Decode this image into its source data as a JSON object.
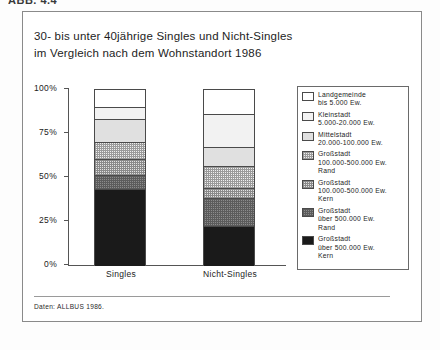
{
  "page": {
    "cut_header": "ABB. 4.4"
  },
  "title": {
    "line1": "30- bis unter 40jährige Singles und Nicht-Singles",
    "line2": "im Vergleich nach dem Wohnstandort 1986"
  },
  "source": "Daten: ALLBUS 1986.",
  "axis": {
    "y_ticks": [
      "100%",
      "75%",
      "50%",
      "25%",
      "0%"
    ],
    "y_tick_values": [
      100,
      75,
      50,
      25,
      0
    ]
  },
  "legend": {
    "items": [
      {
        "name": "Landgemeinde",
        "range": "bis 5.000 Ew.",
        "extra": "",
        "fill": "f0"
      },
      {
        "name": "Kleinstadt",
        "range": "5.000-20.000 Ew.",
        "extra": "",
        "fill": "f1"
      },
      {
        "name": "Mittelstadt",
        "range": "20.000-100.000 Ew.",
        "extra": "",
        "fill": "f2"
      },
      {
        "name": "Großstadt",
        "range": "100.000-500.000 Ew.",
        "extra": "Rand",
        "fill": "f3"
      },
      {
        "name": "Großstadt",
        "range": "100.000-500.000 Ew.",
        "extra": "Kern",
        "fill": "f4"
      },
      {
        "name": "Großstadt",
        "range": "über 500.000 Ew.",
        "extra": "Rand",
        "fill": "f5"
      },
      {
        "name": "Großstadt",
        "range": "über 500.000 Ew.",
        "extra": "Kern",
        "fill": "f6"
      }
    ]
  },
  "chart_data": {
    "type": "bar",
    "subtype": "stacked-100-percent",
    "title": "30- bis unter 40jährige Singles und Nicht-Singles im Vergleich nach dem Wohnstandort 1986",
    "xlabel": "",
    "ylabel": "",
    "ylim": [
      0,
      100
    ],
    "grid": false,
    "legend_position": "right",
    "categories": [
      "Singles",
      "Nicht-Singles"
    ],
    "series": [
      {
        "name": "Landgemeinde bis 5.000 Ew.",
        "fill": "f0",
        "values": [
          10,
          14
        ]
      },
      {
        "name": "Kleinstadt 5.000-20.000 Ew.",
        "fill": "f1",
        "values": [
          7,
          19
        ]
      },
      {
        "name": "Mittelstadt 20.000-100.000 Ew.",
        "fill": "f2",
        "values": [
          13,
          11
        ]
      },
      {
        "name": "Großstadt 100.000-500.000 Ew. Rand",
        "fill": "f3",
        "values": [
          10,
          12
        ]
      },
      {
        "name": "Großstadt 100.000-500.000 Ew. Kern",
        "fill": "f4",
        "values": [
          9,
          6
        ]
      },
      {
        "name": "Großstadt über 500.000 Ew. Rand",
        "fill": "f5",
        "values": [
          8,
          16
        ]
      },
      {
        "name": "Großstadt über 500.000 Ew. Kern",
        "fill": "f6",
        "values": [
          43,
          22
        ]
      }
    ]
  }
}
